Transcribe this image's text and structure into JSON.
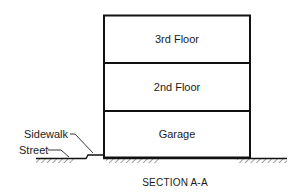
{
  "diagram": {
    "floors": [
      {
        "label": "3rd Floor"
      },
      {
        "label": "2nd Floor"
      },
      {
        "label": "Garage"
      }
    ],
    "annotations": {
      "sidewalk": "Sidewalk",
      "street": "Street"
    },
    "caption": "SECTION A-A",
    "colors": {
      "line": "#111111",
      "hatch": "#444444",
      "background": "#ffffff"
    }
  }
}
